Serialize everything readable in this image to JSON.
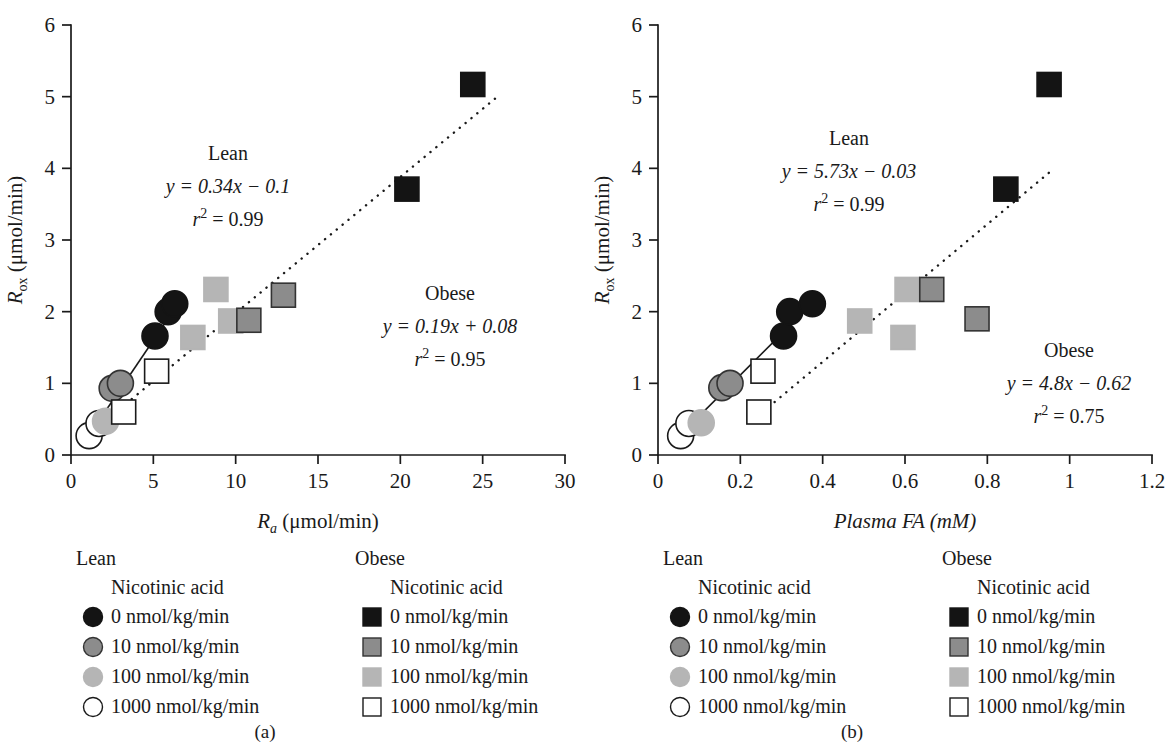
{
  "figure": {
    "panels": [
      {
        "id": "a",
        "caption": "(a)",
        "x_axis_label_main": "R",
        "x_axis_label_sub": "a",
        "x_axis_label_units": " (μmol/min)",
        "y_axis_label_main": "R",
        "y_axis_label_sub": "ox",
        "y_axis_label_units": " (μmol/min)",
        "annotations": [
          {
            "name": "Lean",
            "equation": "y = 0.34x − 0.1",
            "r2_symbol": "r",
            "r2_exp": "2",
            "r2_value": " = 0.99"
          },
          {
            "name": "Obese",
            "equation": "y = 0.19x + 0.08",
            "r2_symbol": "r",
            "r2_exp": "2",
            "r2_value": " = 0.95"
          }
        ]
      },
      {
        "id": "b",
        "caption": "(b)",
        "x_axis_label_main": "Plasma FA (mM)",
        "x_axis_label_sub": "",
        "x_axis_label_units": "",
        "y_axis_label_main": "R",
        "y_axis_label_sub": "ox",
        "y_axis_label_units": " (μmol/min)",
        "annotations": [
          {
            "name": "Lean",
            "equation": "y = 5.73x − 0.03",
            "r2_symbol": "r",
            "r2_exp": "2",
            "r2_value": " = 0.99"
          },
          {
            "name": "Obese",
            "equation": "y = 4.8x − 0.62",
            "r2_symbol": "r",
            "r2_exp": "2",
            "r2_value": " = 0.75"
          }
        ]
      }
    ],
    "legends": [
      {
        "id": "a-lean",
        "group": "Lean",
        "subtitle": "Nicotinic acid",
        "marker_shape": "circle",
        "items": [
          {
            "label": "0 nmol/kg/min",
            "fill": "#141414",
            "stroke": "#141414"
          },
          {
            "label": "10 nmol/kg/min",
            "fill": "#8c8c8c",
            "stroke": "#333333"
          },
          {
            "label": "100 nmol/kg/min",
            "fill": "#b5b5b5",
            "stroke": "#b5b5b5"
          },
          {
            "label": "1000 nmol/kg/min",
            "fill": "#ffffff",
            "stroke": "#1a1a1a"
          }
        ]
      },
      {
        "id": "a-obese",
        "group": "Obese",
        "subtitle": "Nicotinic acid",
        "marker_shape": "square",
        "items": [
          {
            "label": "0 nmol/kg/min",
            "fill": "#141414",
            "stroke": "#141414"
          },
          {
            "label": "10 nmol/kg/min",
            "fill": "#8c8c8c",
            "stroke": "#333333"
          },
          {
            "label": "100 nmol/kg/min",
            "fill": "#b5b5b5",
            "stroke": "#b5b5b5"
          },
          {
            "label": "1000 nmol/kg/min",
            "fill": "#ffffff",
            "stroke": "#1a1a1a"
          }
        ]
      },
      {
        "id": "b-lean",
        "group": "Lean",
        "subtitle": "Nicotinic acid",
        "marker_shape": "circle",
        "items": [
          {
            "label": "0 nmol/kg/min",
            "fill": "#141414",
            "stroke": "#141414"
          },
          {
            "label": "10 nmol/kg/min",
            "fill": "#8c8c8c",
            "stroke": "#333333"
          },
          {
            "label": "100 nmol/kg/min",
            "fill": "#b5b5b5",
            "stroke": "#b5b5b5"
          },
          {
            "label": "1000 nmol/kg/min",
            "fill": "#ffffff",
            "stroke": "#1a1a1a"
          }
        ]
      },
      {
        "id": "b-obese",
        "group": "Obese",
        "subtitle": "Nicotinic acid",
        "marker_shape": "square",
        "items": [
          {
            "label": "0 nmol/kg/min",
            "fill": "#141414",
            "stroke": "#141414"
          },
          {
            "label": "10 nmol/kg/min",
            "fill": "#8c8c8c",
            "stroke": "#333333"
          },
          {
            "label": "100 nmol/kg/min",
            "fill": "#b5b5b5",
            "stroke": "#b5b5b5"
          },
          {
            "label": "1000 nmol/kg/min",
            "fill": "#ffffff",
            "stroke": "#1a1a1a"
          }
        ]
      }
    ]
  },
  "chart_data": [
    {
      "panel": "a",
      "type": "scatter",
      "title": "",
      "xlabel": "Ra (μmol/min)",
      "ylabel": "Rox (μmol/min)",
      "xlim": [
        0,
        30
      ],
      "ylim": [
        0,
        6
      ],
      "xticks": [
        0,
        5,
        10,
        15,
        20,
        25,
        30
      ],
      "xtick_labels": [
        "0",
        "5",
        "10",
        "15",
        "20",
        "25",
        "30"
      ],
      "yticks": [
        0,
        1,
        2,
        3,
        4,
        5,
        6
      ],
      "ytick_labels": [
        "0",
        "1",
        "2",
        "3",
        "4",
        "5",
        "6"
      ],
      "grid": false,
      "legend_position": "below",
      "series": [
        {
          "name": "Lean",
          "marker": "circle",
          "points": [
            {
              "x": 1.1,
              "y": 0.27,
              "dose": "1000 nmol/kg/min",
              "fill": "#ffffff",
              "stroke": "#1a1a1a"
            },
            {
              "x": 1.7,
              "y": 0.44,
              "dose": "1000 nmol/kg/min",
              "fill": "#ffffff",
              "stroke": "#1a1a1a"
            },
            {
              "x": 2.1,
              "y": 0.47,
              "dose": "100 nmol/kg/min",
              "fill": "#b5b5b5",
              "stroke": "#b5b5b5"
            },
            {
              "x": 2.5,
              "y": 0.93,
              "dose": "10 nmol/kg/min",
              "fill": "#8c8c8c",
              "stroke": "#333333"
            },
            {
              "x": 3.0,
              "y": 1.0,
              "dose": "10 nmol/kg/min",
              "fill": "#8c8c8c",
              "stroke": "#333333"
            },
            {
              "x": 5.1,
              "y": 1.66,
              "dose": "0 nmol/kg/min",
              "fill": "#141414",
              "stroke": "#141414"
            },
            {
              "x": 5.9,
              "y": 2.0,
              "dose": "0 nmol/kg/min",
              "fill": "#141414",
              "stroke": "#141414"
            },
            {
              "x": 6.3,
              "y": 2.11,
              "dose": "0 nmol/kg/min",
              "fill": "#141414",
              "stroke": "#141414"
            }
          ],
          "fit": {
            "slope": 0.34,
            "intercept": -0.1,
            "style": "solid",
            "x_start": 1.0,
            "x_end": 6.4
          }
        },
        {
          "name": "Obese",
          "marker": "square",
          "points": [
            {
              "x": 3.2,
              "y": 0.6,
              "dose": "1000 nmol/kg/min",
              "fill": "#ffffff",
              "stroke": "#1a1a1a"
            },
            {
              "x": 5.2,
              "y": 1.17,
              "dose": "1000 nmol/kg/min",
              "fill": "#ffffff",
              "stroke": "#1a1a1a"
            },
            {
              "x": 7.4,
              "y": 1.64,
              "dose": "100 nmol/kg/min",
              "fill": "#b5b5b5",
              "stroke": "#b5b5b5"
            },
            {
              "x": 8.8,
              "y": 2.31,
              "dose": "100 nmol/kg/min",
              "fill": "#b5b5b5",
              "stroke": "#b5b5b5"
            },
            {
              "x": 9.7,
              "y": 1.87,
              "dose": "100 nmol/kg/min",
              "fill": "#b5b5b5",
              "stroke": "#b5b5b5"
            },
            {
              "x": 10.8,
              "y": 1.88,
              "dose": "10 nmol/kg/min",
              "fill": "#8c8c8c",
              "stroke": "#333333"
            },
            {
              "x": 12.9,
              "y": 2.23,
              "dose": "10 nmol/kg/min",
              "fill": "#8c8c8c",
              "stroke": "#333333"
            },
            {
              "x": 20.4,
              "y": 3.71,
              "dose": "0 nmol/kg/min",
              "fill": "#141414",
              "stroke": "#141414"
            },
            {
              "x": 24.4,
              "y": 5.17,
              "dose": "0 nmol/kg/min",
              "fill": "#141414",
              "stroke": "#141414"
            }
          ],
          "fit": {
            "slope": 0.19,
            "intercept": 0.08,
            "style": "dotted",
            "x_start": 1.2,
            "x_end": 26.0
          }
        }
      ]
    },
    {
      "panel": "b",
      "type": "scatter",
      "title": "",
      "xlabel": "Plasma FA (mM)",
      "ylabel": "Rox (μmol/min)",
      "xlim": [
        0,
        1.2
      ],
      "ylim": [
        0,
        6
      ],
      "xticks": [
        0,
        0.2,
        0.4,
        0.6,
        0.8,
        1.0,
        1.2
      ],
      "xtick_labels": [
        "0",
        "0.2",
        "0.4",
        "0.6",
        "0.8",
        "1",
        "1.2"
      ],
      "yticks": [
        0,
        1,
        2,
        3,
        4,
        5,
        6
      ],
      "ytick_labels": [
        "0",
        "1",
        "2",
        "3",
        "4",
        "5",
        "6"
      ],
      "grid": false,
      "legend_position": "below",
      "series": [
        {
          "name": "Lean",
          "marker": "circle",
          "points": [
            {
              "x": 0.055,
              "y": 0.27,
              "dose": "1000 nmol/kg/min",
              "fill": "#ffffff",
              "stroke": "#1a1a1a"
            },
            {
              "x": 0.075,
              "y": 0.44,
              "dose": "1000 nmol/kg/min",
              "fill": "#ffffff",
              "stroke": "#1a1a1a"
            },
            {
              "x": 0.105,
              "y": 0.45,
              "dose": "100 nmol/kg/min",
              "fill": "#b5b5b5",
              "stroke": "#b5b5b5"
            },
            {
              "x": 0.155,
              "y": 0.94,
              "dose": "10 nmol/kg/min",
              "fill": "#8c8c8c",
              "stroke": "#333333"
            },
            {
              "x": 0.175,
              "y": 1.0,
              "dose": "10 nmol/kg/min",
              "fill": "#8c8c8c",
              "stroke": "#333333"
            },
            {
              "x": 0.305,
              "y": 1.66,
              "dose": "0 nmol/kg/min",
              "fill": "#141414",
              "stroke": "#141414"
            },
            {
              "x": 0.32,
              "y": 2.0,
              "dose": "0 nmol/kg/min",
              "fill": "#141414",
              "stroke": "#141414"
            },
            {
              "x": 0.375,
              "y": 2.11,
              "dose": "0 nmol/kg/min",
              "fill": "#141414",
              "stroke": "#141414"
            }
          ],
          "fit": {
            "slope": 5.73,
            "intercept": -0.03,
            "style": "solid",
            "x_start": 0.05,
            "x_end": 0.38
          }
        },
        {
          "name": "Obese",
          "marker": "square",
          "points": [
            {
              "x": 0.245,
              "y": 0.6,
              "dose": "1000 nmol/kg/min",
              "fill": "#ffffff",
              "stroke": "#1a1a1a"
            },
            {
              "x": 0.255,
              "y": 1.17,
              "dose": "1000 nmol/kg/min",
              "fill": "#ffffff",
              "stroke": "#1a1a1a"
            },
            {
              "x": 0.49,
              "y": 1.87,
              "dose": "100 nmol/kg/min",
              "fill": "#b5b5b5",
              "stroke": "#b5b5b5"
            },
            {
              "x": 0.595,
              "y": 1.64,
              "dose": "100 nmol/kg/min",
              "fill": "#b5b5b5",
              "stroke": "#b5b5b5"
            },
            {
              "x": 0.605,
              "y": 2.31,
              "dose": "100 nmol/kg/min",
              "fill": "#b5b5b5",
              "stroke": "#b5b5b5"
            },
            {
              "x": 0.665,
              "y": 2.31,
              "dose": "10 nmol/kg/min",
              "fill": "#8c8c8c",
              "stroke": "#333333"
            },
            {
              "x": 0.775,
              "y": 1.9,
              "dose": "10 nmol/kg/min",
              "fill": "#8c8c8c",
              "stroke": "#333333"
            },
            {
              "x": 0.845,
              "y": 3.71,
              "dose": "0 nmol/kg/min",
              "fill": "#141414",
              "stroke": "#141414"
            },
            {
              "x": 0.95,
              "y": 5.17,
              "dose": "0 nmol/kg/min",
              "fill": "#141414",
              "stroke": "#141414"
            }
          ],
          "fit": {
            "slope": 4.8,
            "intercept": -0.62,
            "style": "dotted",
            "x_start": 0.255,
            "x_end": 0.96
          }
        }
      ]
    }
  ]
}
